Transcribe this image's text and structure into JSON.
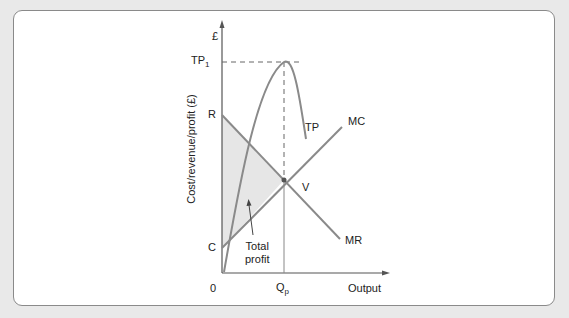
{
  "diagram": {
    "y_axis_label": "Cost/revenue/profit (£)",
    "y_axis_top": "£",
    "x_axis_label": "Output",
    "origin": "0",
    "tp1_label": "TP",
    "tp1_sub": "1",
    "qp_label": "Q",
    "qp_sub": "p",
    "r_label": "R",
    "c_label": "C",
    "v_label": "V",
    "curves": {
      "tp": "TP",
      "mc": "MC",
      "mr": "MR"
    },
    "annotation_line1": "Total",
    "annotation_line2": "profit",
    "colors": {
      "curve": "#8a8a8a",
      "axis": "#555555",
      "shade": "#e6e6e6",
      "background": "#e9e9e9"
    }
  }
}
